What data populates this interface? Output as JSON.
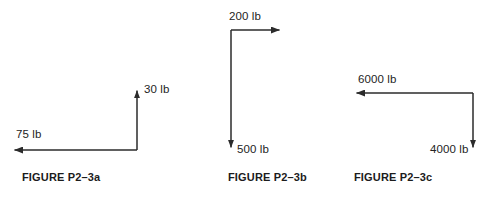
{
  "page": {
    "background_color": "#ffffff",
    "line_color": "#2b2b2b",
    "text_color": "#232323"
  },
  "figures": [
    {
      "id": "a",
      "caption": "FIGURE P2–3a",
      "forces": [
        {
          "name": "vertical",
          "label": "30 lb",
          "magnitude": 30,
          "unit": "lb",
          "direction": "up"
        },
        {
          "name": "horizontal",
          "label": "75 lb",
          "magnitude": 75,
          "unit": "lb",
          "direction": "left"
        }
      ]
    },
    {
      "id": "b",
      "caption": "FIGURE P2–3b",
      "forces": [
        {
          "name": "horizontal",
          "label": "200 lb",
          "magnitude": 200,
          "unit": "lb",
          "direction": "right"
        },
        {
          "name": "vertical",
          "label": "500 lb",
          "magnitude": 500,
          "unit": "lb",
          "direction": "down"
        }
      ]
    },
    {
      "id": "c",
      "caption": "FIGURE P2–3c",
      "forces": [
        {
          "name": "horizontal",
          "label": "6000 lb",
          "magnitude": 6000,
          "unit": "lb",
          "direction": "left"
        },
        {
          "name": "vertical",
          "label": "4000 lb",
          "magnitude": 4000,
          "unit": "lb",
          "direction": "down"
        }
      ]
    }
  ]
}
